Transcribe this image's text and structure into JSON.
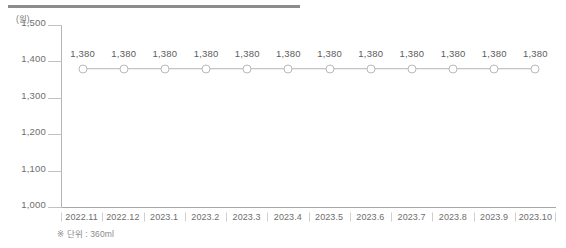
{
  "chart_data": {
    "type": "line",
    "title": "",
    "subtitle": "",
    "xlabel": "",
    "ylabel": "(원)",
    "y_unit_label": "(원)",
    "categories": [
      "2022.11",
      "2022.12",
      "2023.1",
      "2023.2",
      "2023.3",
      "2023.4",
      "2023.5",
      "2023.6",
      "2023.7",
      "2023.8",
      "2023.9",
      "2023.10"
    ],
    "values": [
      1380,
      1380,
      1380,
      1380,
      1380,
      1380,
      1380,
      1380,
      1380,
      1380,
      1380,
      1380
    ],
    "point_labels": [
      "1,380",
      "1,380",
      "1,380",
      "1,380",
      "1,380",
      "1,380",
      "1,380",
      "1,380",
      "1,380",
      "1,380",
      "1,380",
      "1,380"
    ],
    "ylim": [
      1000,
      1500
    ],
    "yticks": [
      1500,
      1400,
      1300,
      1200,
      1100,
      1000
    ],
    "ytick_labels": [
      "1,500",
      "1,400",
      "1,300",
      "1,200",
      "1,100",
      "1,000"
    ],
    "grid": false,
    "legend": null,
    "annotations": [
      "※ 단위 : 360ml"
    ],
    "series_color": "#b9b9b9",
    "marker_fill": "#ffffff",
    "text_color": "#6e6e6e"
  },
  "footnote": "※ 단위 : 360ml",
  "decor": {
    "top_rule_color": "#8c8c8c"
  }
}
